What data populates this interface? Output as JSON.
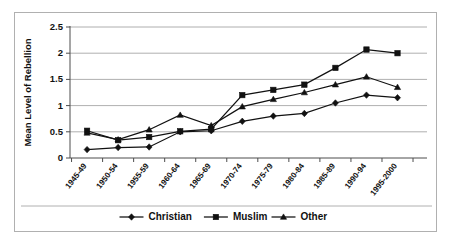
{
  "chart_data": {
    "type": "line",
    "title": "",
    "xlabel": "",
    "ylabel": "Mean Level of Rebellion",
    "ylim": [
      0,
      2.5
    ],
    "yticks": [
      0,
      0.5,
      1,
      1.5,
      2,
      2.5
    ],
    "ytick_labels": [
      "0",
      "0.5",
      "1",
      "1.5",
      "2",
      "2.5"
    ],
    "grid": true,
    "legend_position": "bottom",
    "categories": [
      "1945-49",
      "1950-54",
      "1955-59",
      "1960-64",
      "1965-69",
      "1970-74",
      "1975-79",
      "1980-84",
      "1985-89",
      "1990-94",
      "1995-2000"
    ],
    "series": [
      {
        "name": "Christian",
        "marker": "diamond",
        "values": [
          0.16,
          0.2,
          0.21,
          0.5,
          0.52,
          0.7,
          0.8,
          0.85,
          1.05,
          1.2,
          1.15
        ]
      },
      {
        "name": "Muslim",
        "marker": "square",
        "values": [
          0.52,
          0.34,
          0.4,
          0.51,
          0.55,
          1.2,
          1.3,
          1.4,
          1.72,
          2.07,
          2.0
        ]
      },
      {
        "name": "Other",
        "marker": "triangle",
        "values": [
          0.48,
          0.35,
          0.54,
          0.82,
          0.62,
          0.98,
          1.12,
          1.25,
          1.4,
          1.55,
          1.35
        ]
      }
    ]
  },
  "legend": {
    "entries": [
      {
        "label": "Christian",
        "marker": "diamond"
      },
      {
        "label": "Muslim",
        "marker": "square"
      },
      {
        "label": "Other",
        "marker": "triangle"
      }
    ]
  }
}
